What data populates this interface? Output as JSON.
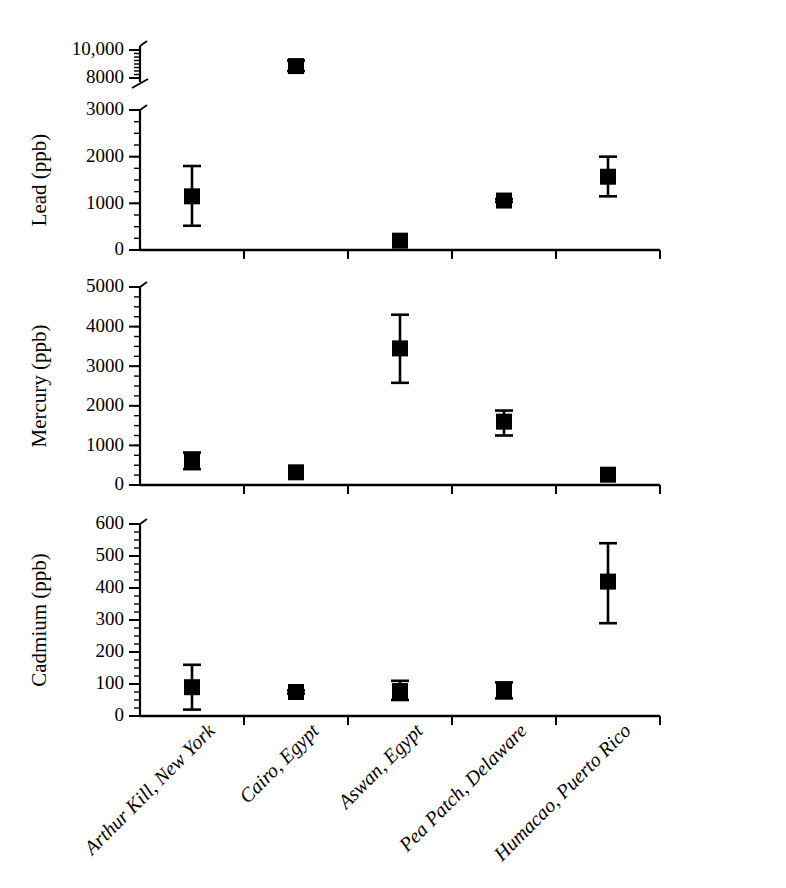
{
  "chart_data": {
    "type": "scatter",
    "title": "",
    "xlabel": "",
    "grid": false,
    "legend": "none",
    "categories": [
      "Arthur Kill, New York",
      "Cairo, Egypt",
      "Aswan, Egypt",
      "Pea Patch, Delaware",
      "Humacao, Puerto Rico"
    ],
    "panels": [
      {
        "id": "lead",
        "ylabel": "Lead (ppb)",
        "units": "ppb",
        "broken_axis": true,
        "ylim": [
          0,
          3000
        ],
        "yticks": [
          0,
          1000,
          2000,
          3000
        ],
        "yticklabels": [
          "0",
          "1000",
          "2000",
          "3000"
        ],
        "minor_tick_step": 250,
        "break_segment": {
          "ylim": [
            8000,
            10000
          ],
          "yticks": [
            8000,
            10000
          ],
          "yticklabels": [
            "8000",
            "10,000"
          ],
          "minor_tick_step": 250
        },
        "values": [
          1150,
          8850,
          200,
          1060,
          1570
        ],
        "err_low": [
          520,
          8500,
          200,
          1030,
          1150
        ],
        "err_high": [
          1800,
          9250,
          200,
          1090,
          2000
        ]
      },
      {
        "id": "mercury",
        "ylabel": "Mercury (ppb)",
        "units": "ppb",
        "broken_axis": false,
        "ylim": [
          0,
          5000
        ],
        "yticks": [
          0,
          1000,
          2000,
          3000,
          4000,
          5000
        ],
        "yticklabels": [
          "0",
          "1000",
          "2000",
          "3000",
          "4000",
          "5000"
        ],
        "minor_tick_step": 250,
        "values": [
          600,
          320,
          3450,
          1600,
          260
        ],
        "err_low": [
          400,
          300,
          2580,
          1250,
          250
        ],
        "err_high": [
          820,
          340,
          4300,
          1880,
          280
        ]
      },
      {
        "id": "cadmium",
        "ylabel": "Cadmium (ppb)",
        "units": "ppb",
        "broken_axis": false,
        "ylim": [
          0,
          600
        ],
        "yticks": [
          0,
          100,
          200,
          300,
          400,
          500,
          600
        ],
        "yticklabels": [
          "0",
          "100",
          "200",
          "300",
          "400",
          "500",
          "600"
        ],
        "minor_tick_step": 25,
        "values": [
          90,
          75,
          78,
          80,
          420
        ],
        "err_low": [
          20,
          70,
          50,
          55,
          290
        ],
        "err_high": [
          160,
          80,
          110,
          105,
          540
        ]
      }
    ]
  },
  "colors": {
    "marker": "#000000",
    "axis": "#000000",
    "background": "#ffffff"
  }
}
